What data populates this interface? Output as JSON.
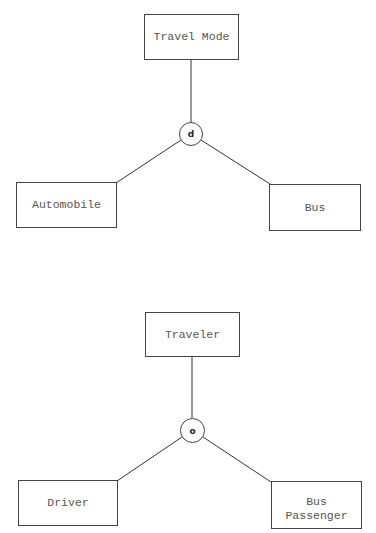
{
  "diagrams": [
    {
      "supertype": "Travel Mode",
      "constraint": "d",
      "subtypes": [
        "Automobile",
        "Bus"
      ]
    },
    {
      "supertype": "Traveler",
      "constraint": "o",
      "subtypes": [
        "Driver",
        "Bus\nPassenger"
      ]
    }
  ],
  "colors": {
    "line": "#333333",
    "text": "#555555",
    "background": "#ffffff"
  }
}
